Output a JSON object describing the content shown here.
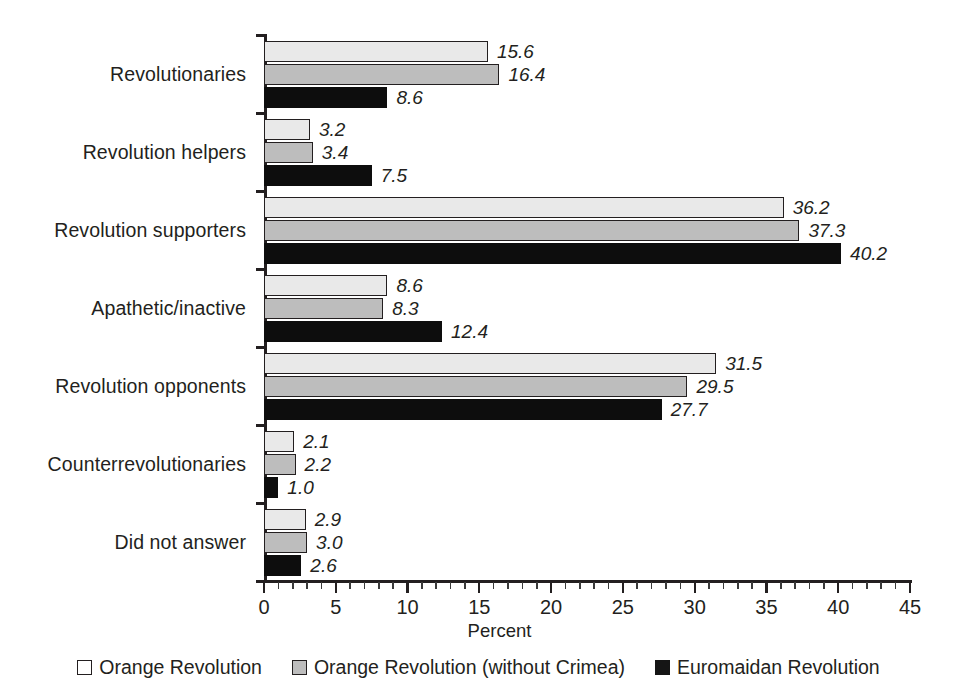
{
  "chart_data": {
    "type": "bar",
    "orientation": "horizontal",
    "title": "",
    "xlabel": "Percent",
    "ylabel": "",
    "xlim": [
      0,
      45
    ],
    "x_major_step": 5,
    "x_minor_step": 1,
    "x_ticks": [
      "0",
      "5",
      "10",
      "15",
      "20",
      "25",
      "30",
      "35",
      "40",
      "45"
    ],
    "grid": false,
    "legend_position": "bottom",
    "value_label_format": "one-decimal-italic",
    "categories": [
      "Revolutionaries",
      "Revolution helpers",
      "Revolution supporters",
      "Apathetic/inactive",
      "Revolution opponents",
      "Counterrevolutionaries",
      "Did not answer"
    ],
    "series": [
      {
        "name": "Orange Revolution",
        "color": "#e9e9e9",
        "border": "#231f20",
        "legend_swatch": "#ffffff",
        "values": [
          15.6,
          3.2,
          36.2,
          8.6,
          31.5,
          2.1,
          2.9
        ],
        "labels": [
          "15.6",
          "3.2",
          "36.2",
          "8.6",
          "31.5",
          "2.1",
          "2.9"
        ]
      },
      {
        "name": "Orange Revolution (without Crimea)",
        "color": "#bdbdbd",
        "border": "#231f20",
        "legend_swatch": "#bdbdbd",
        "values": [
          16.4,
          3.4,
          37.3,
          8.3,
          29.5,
          2.2,
          3.0
        ],
        "labels": [
          "16.4",
          "3.4",
          "37.3",
          "8.3",
          "29.5",
          "2.2",
          "3.0"
        ]
      },
      {
        "name": "Euromaidan Revolution",
        "color": "#0d0d0d",
        "border": "#0d0d0d",
        "legend_swatch": "#151515",
        "values": [
          8.6,
          7.5,
          40.2,
          12.4,
          27.7,
          1.0,
          2.6
        ],
        "labels": [
          "8.6",
          "7.5",
          "40.2",
          "12.4",
          "27.7",
          "1.0",
          "2.6"
        ]
      }
    ]
  }
}
